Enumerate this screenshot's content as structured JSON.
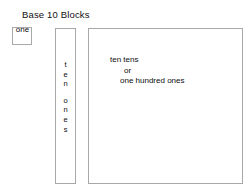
{
  "diagram": {
    "title": "Base 10 Blocks",
    "blocks": {
      "ones": {
        "label": "one"
      },
      "tens": {
        "line_top": "t\ne\nn",
        "letters_top": "ten",
        "letters_bottom": "ones",
        "label_full": "ten ones"
      },
      "hundreds": {
        "line1": "ten tens",
        "line2": "or",
        "line3": "one hundred ones"
      }
    },
    "colors": {
      "background": "#ffffff",
      "border": "#a8a8a8",
      "text": "#0d0d0d"
    }
  }
}
